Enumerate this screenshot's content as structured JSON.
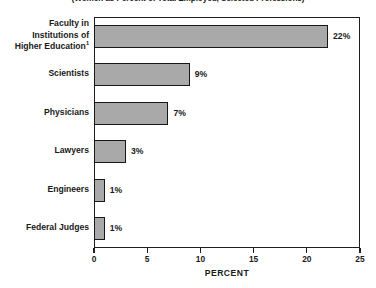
{
  "chart_data": {
    "type": "bar",
    "orientation": "horizontal",
    "title": "(Women as Percent of Total Employed, Selected Professions)",
    "xlabel": "PERCENT",
    "ylabel": "",
    "xlim": [
      0,
      25
    ],
    "xticks": [
      0,
      5,
      10,
      15,
      20,
      25
    ],
    "xtick_labels": [
      "0",
      "5",
      "10",
      "15",
      "20",
      "25"
    ],
    "grid": false,
    "legend": false,
    "bar_color": "#a9a9a9",
    "bar_border_color": "#171717",
    "frame_color": "#1e1e1e",
    "categories": [
      "Faculty in Institutions of Higher Education",
      "Scientists",
      "Physicians",
      "Lawyers",
      "Engineers",
      "Federal Judges"
    ],
    "values": [
      22,
      9,
      7,
      3,
      1,
      1
    ],
    "value_labels": [
      "22%",
      "9%",
      "7%",
      "3%",
      "1%",
      "1%"
    ],
    "category_label_lines": [
      [
        "Faculty in",
        "Institutions of",
        "Higher Education"
      ],
      [
        "Scientists"
      ],
      [
        "Physicians"
      ],
      [
        "Lawyers"
      ],
      [
        "Engineers"
      ],
      [
        "Federal Judges"
      ]
    ],
    "footnote_marker": "1",
    "footnote_on_category_index": 0
  }
}
